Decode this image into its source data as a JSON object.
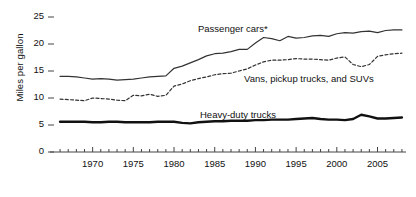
{
  "chart_data": {
    "type": "line",
    "title": "",
    "subtitle": "",
    "xlabel": "",
    "ylabel": "Miles per gallon",
    "xlim": [
      1965.5,
      2008.5
    ],
    "ylim": [
      0,
      26.5
    ],
    "grid": false,
    "legend_position": "inline-annotations",
    "y_ticks": [
      0,
      5,
      10,
      15,
      20,
      25
    ],
    "y_tick_labels": [
      "0",
      "5",
      "10",
      "15",
      "20",
      "25"
    ],
    "x_ticks": [
      1970,
      1975,
      1980,
      1985,
      1990,
      1995,
      2000,
      2005
    ],
    "x_tick_labels": [
      "1970",
      "1975",
      "1980",
      "1985",
      "1990",
      "1995",
      "2000",
      "2005"
    ],
    "x_minor_tick_interval": 1,
    "annotations": [
      {
        "text": "Passenger cars*",
        "x_px": 198,
        "y_px": 23
      },
      {
        "text": "Vans, pickup trucks, and SUVs",
        "x_px": 244,
        "y_px": 73
      },
      {
        "text": "Heavy-duty trucks",
        "x_px": 200,
        "y_px": 109
      }
    ],
    "x": [
      1966,
      1967,
      1968,
      1969,
      1970,
      1971,
      1972,
      1973,
      1974,
      1975,
      1976,
      1977,
      1978,
      1979,
      1980,
      1981,
      1982,
      1983,
      1984,
      1985,
      1986,
      1987,
      1988,
      1989,
      1990,
      1991,
      1992,
      1993,
      1994,
      1995,
      1996,
      1997,
      1998,
      1999,
      2000,
      2001,
      2002,
      2003,
      2004,
      2005,
      2006,
      2007,
      2008
    ],
    "series": [
      {
        "name": "Passenger cars*",
        "style": "solid",
        "width": 1.2,
        "color": "#333333",
        "values": [
          14.0,
          14.0,
          13.9,
          13.7,
          13.5,
          13.6,
          13.5,
          13.3,
          13.4,
          13.5,
          13.7,
          13.9,
          14.0,
          14.1,
          15.5,
          15.9,
          16.5,
          17.1,
          17.8,
          18.2,
          18.3,
          18.6,
          19.0,
          19.0,
          20.2,
          21.2,
          21.0,
          20.6,
          21.4,
          21.1,
          21.2,
          21.5,
          21.6,
          21.4,
          21.9,
          22.1,
          22.0,
          22.3,
          22.4,
          22.1,
          22.5,
          22.6,
          22.6
        ]
      },
      {
        "name": "Vans, pickup trucks, and SUVs",
        "style": "dashed",
        "width": 1.2,
        "color": "#333333",
        "values": [
          9.8,
          9.7,
          9.6,
          9.5,
          10.0,
          9.9,
          9.8,
          9.6,
          9.5,
          10.5,
          10.4,
          10.7,
          10.3,
          10.5,
          12.2,
          12.6,
          13.2,
          13.6,
          13.9,
          14.3,
          14.5,
          14.6,
          15.0,
          15.4,
          16.1,
          16.7,
          17.0,
          17.0,
          17.1,
          17.3,
          17.2,
          17.2,
          17.1,
          17.0,
          17.4,
          17.6,
          16.2,
          15.8,
          16.2,
          17.7,
          18.0,
          18.2,
          18.3
        ]
      },
      {
        "name": "Heavy-duty trucks",
        "style": "solid",
        "width": 2.4,
        "color": "#111111",
        "values": [
          5.6,
          5.6,
          5.6,
          5.6,
          5.5,
          5.5,
          5.6,
          5.6,
          5.5,
          5.5,
          5.5,
          5.5,
          5.6,
          5.6,
          5.6,
          5.4,
          5.3,
          5.5,
          5.6,
          5.7,
          5.7,
          5.8,
          5.8,
          5.8,
          5.9,
          5.9,
          6.0,
          6.0,
          6.0,
          6.1,
          6.2,
          6.3,
          6.1,
          6.0,
          6.0,
          5.9,
          6.1,
          6.9,
          6.6,
          6.2,
          6.2,
          6.3,
          6.4
        ]
      }
    ]
  }
}
